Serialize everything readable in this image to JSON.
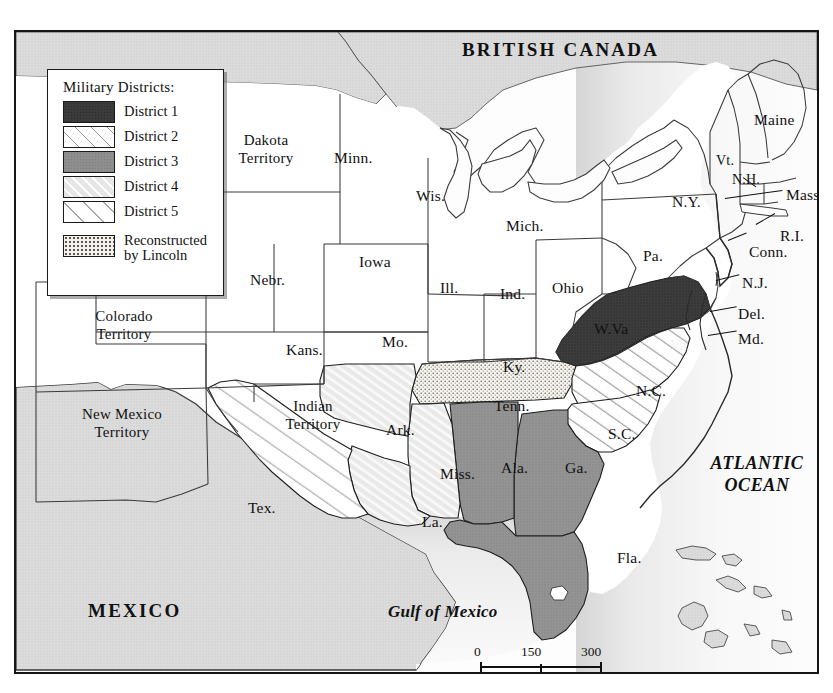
{
  "map": {
    "title_country_north": "BRITISH CANADA",
    "title_country_south": "MEXICO",
    "ocean_atlantic_line1": "ATLANTIC",
    "ocean_atlantic_line2": "OCEAN",
    "gulf": "Gulf of Mexico"
  },
  "legend": {
    "title": "Military Districts:",
    "items": [
      {
        "label": "District 1",
        "pattern": "solid-dark",
        "color": "#3b3b3b"
      },
      {
        "label": "District 2",
        "pattern": "diagonal-lines-white",
        "color": "#ffffff"
      },
      {
        "label": "District 3",
        "pattern": "solid-medium-gray",
        "color": "#8e8e8e"
      },
      {
        "label": "District 4",
        "pattern": "diagonal-lines-light-gray",
        "color": "#e6e6e6"
      },
      {
        "label": "District 5",
        "pattern": "sparse-diagonal-lines-white",
        "color": "#ffffff"
      },
      {
        "label_line1": "Reconstructed",
        "label_line2": "by Lincoln",
        "pattern": "stipple",
        "color": "#f3f1ea"
      }
    ]
  },
  "scale": {
    "ticks": [
      "0",
      "150",
      "300"
    ],
    "unit": "Miles"
  },
  "labels": {
    "dakota_territory_l1": "Dakota",
    "dakota_territory_l2": "Territory",
    "colorado_territory_l1": "Colorado",
    "colorado_territory_l2": "Territory",
    "new_mexico_territory_l1": "New Mexico",
    "new_mexico_territory_l2": "Territory",
    "indian_territory_l1": "Indian",
    "indian_territory_l2": "Territory",
    "minn": "Minn.",
    "wis": "Wis.",
    "mich": "Mich.",
    "iowa": "Iowa",
    "nebr": "Nebr.",
    "kans": "Kans.",
    "mo": "Mo.",
    "ill": "Ill.",
    "ind": "Ind.",
    "ohio": "Ohio",
    "pa": "Pa.",
    "ny": "N.Y.",
    "vt": "Vt.",
    "nh": "N.H.",
    "maine": "Maine",
    "mass": "Mass.",
    "ri": "R.I.",
    "conn": "Conn.",
    "nj": "N.J.",
    "del": "Del.",
    "md": "Md.",
    "wva": "W.Va",
    "va": "Va.",
    "ky": "Ky.",
    "tenn": "Tenn.",
    "nc": "N.C.",
    "sc": "S.C.",
    "ark": "Ark.",
    "miss": "Miss.",
    "la": "La.",
    "tex": "Tex.",
    "ala": "Ala.",
    "ga": "Ga.",
    "fla": "Fla."
  },
  "districts": {
    "district_1": [
      "Va."
    ],
    "district_2": [
      "N.C.",
      "S.C."
    ],
    "district_3": [
      "Ala.",
      "Ga.",
      "Fla."
    ],
    "district_4": [
      "Ark.",
      "Miss.",
      "La."
    ],
    "district_5": [
      "Tex."
    ],
    "reconstructed_by_lincoln": [
      "Tenn."
    ]
  }
}
